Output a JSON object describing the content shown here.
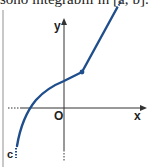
{
  "header": {
    "text": "sono integrabili in [a; b]. Indic"
  },
  "diagram": {
    "axes": {
      "x_label": "x",
      "y_label": "y",
      "origin_label": "O"
    },
    "point_labels": {
      "c": "c"
    },
    "colors": {
      "curve": "#1f4e8c",
      "axes": "#222222",
      "border": "#c8c8c8"
    }
  }
}
